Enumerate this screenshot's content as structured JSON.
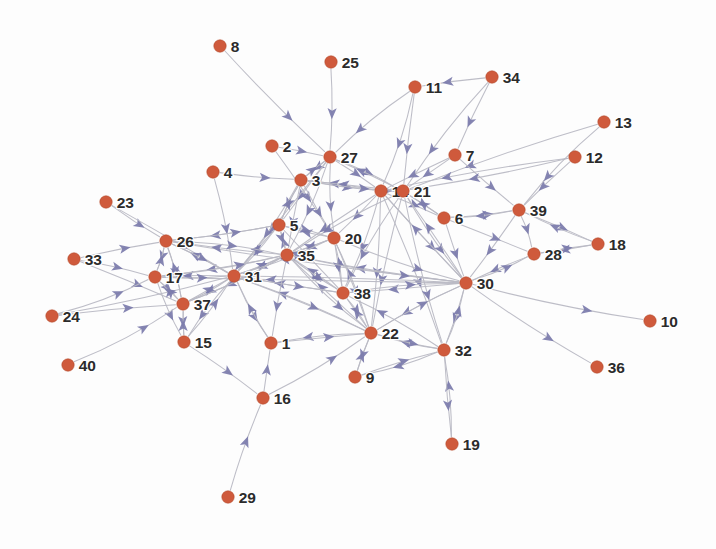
{
  "figure": {
    "background_color": "#fdfdfd",
    "width": 716,
    "height": 549
  },
  "style": {
    "node_fill": "#cf5a3c",
    "node_stroke": "#b4492c",
    "node_radius": 6.2,
    "edge_color": "#b9b9c4",
    "arrow_color": "#7b7bab",
    "label_color": "#2b2b2b",
    "label_font_size": 15.5
  },
  "chart_data": {
    "type": "scatter",
    "title": "",
    "xlabel": "",
    "ylabel": "",
    "grid": false,
    "legend": null,
    "graph_kind": "directed-node-link-diagram",
    "node_count": 40,
    "edge_count": 152,
    "nodes": [
      {
        "id": "1",
        "x": 271,
        "y": 343
      },
      {
        "id": "2",
        "x": 272,
        "y": 146
      },
      {
        "id": "3",
        "x": 301,
        "y": 180
      },
      {
        "id": "4",
        "x": 213,
        "y": 172
      },
      {
        "id": "5",
        "x": 279,
        "y": 225
      },
      {
        "id": "6",
        "x": 444,
        "y": 218
      },
      {
        "id": "7",
        "x": 455,
        "y": 155
      },
      {
        "id": "8",
        "x": 220,
        "y": 46
      },
      {
        "id": "9",
        "x": 355,
        "y": 377
      },
      {
        "id": "10",
        "x": 650,
        "y": 321
      },
      {
        "id": "11",
        "x": 415,
        "y": 87
      },
      {
        "id": "12",
        "x": 575,
        "y": 157
      },
      {
        "id": "13",
        "x": 604,
        "y": 122
      },
      {
        "id": "14",
        "x": 381,
        "y": 191
      },
      {
        "id": "15",
        "x": 184,
        "y": 342
      },
      {
        "id": "16",
        "x": 263,
        "y": 398
      },
      {
        "id": "17",
        "x": 155,
        "y": 277
      },
      {
        "id": "18",
        "x": 598,
        "y": 244
      },
      {
        "id": "19",
        "x": 452,
        "y": 444
      },
      {
        "id": "20",
        "x": 334,
        "y": 238
      },
      {
        "id": "21",
        "x": 403,
        "y": 191
      },
      {
        "id": "22",
        "x": 371,
        "y": 333
      },
      {
        "id": "23",
        "x": 106,
        "y": 202
      },
      {
        "id": "24",
        "x": 52,
        "y": 316
      },
      {
        "id": "25",
        "x": 331,
        "y": 62
      },
      {
        "id": "26",
        "x": 166,
        "y": 241
      },
      {
        "id": "27",
        "x": 330,
        "y": 157
      },
      {
        "id": "28",
        "x": 534,
        "y": 254
      },
      {
        "id": "29",
        "x": 228,
        "y": 497
      },
      {
        "id": "30",
        "x": 466,
        "y": 283
      },
      {
        "id": "31",
        "x": 234,
        "y": 276
      },
      {
        "id": "32",
        "x": 444,
        "y": 350
      },
      {
        "id": "33",
        "x": 74,
        "y": 259
      },
      {
        "id": "34",
        "x": 492,
        "y": 77
      },
      {
        "id": "35",
        "x": 287,
        "y": 255
      },
      {
        "id": "36",
        "x": 597,
        "y": 367
      },
      {
        "id": "37",
        "x": 183,
        "y": 304
      },
      {
        "id": "38",
        "x": 343,
        "y": 293
      },
      {
        "id": "39",
        "x": 519,
        "y": 210
      },
      {
        "id": "40",
        "x": 68,
        "y": 365
      }
    ],
    "edges": [
      [
        "8",
        "27"
      ],
      [
        "25",
        "27"
      ],
      [
        "11",
        "27"
      ],
      [
        "34",
        "11"
      ],
      [
        "34",
        "21"
      ],
      [
        "11",
        "14"
      ],
      [
        "2",
        "27"
      ],
      [
        "2",
        "20"
      ],
      [
        "4",
        "3"
      ],
      [
        "4",
        "31"
      ],
      [
        "23",
        "26"
      ],
      [
        "23",
        "31"
      ],
      [
        "13",
        "21"
      ],
      [
        "12",
        "39"
      ],
      [
        "7",
        "39"
      ],
      [
        "7",
        "14"
      ],
      [
        "7",
        "21"
      ],
      [
        "12",
        "14"
      ],
      [
        "27",
        "3"
      ],
      [
        "27",
        "14"
      ],
      [
        "27",
        "21"
      ],
      [
        "27",
        "35"
      ],
      [
        "27",
        "5"
      ],
      [
        "27",
        "31"
      ],
      [
        "3",
        "27"
      ],
      [
        "3",
        "5"
      ],
      [
        "3",
        "35"
      ],
      [
        "3",
        "20"
      ],
      [
        "3",
        "31"
      ],
      [
        "3",
        "14"
      ],
      [
        "14",
        "3"
      ],
      [
        "14",
        "21"
      ],
      [
        "14",
        "6"
      ],
      [
        "14",
        "20"
      ],
      [
        "14",
        "35"
      ],
      [
        "14",
        "38"
      ],
      [
        "14",
        "30"
      ],
      [
        "14",
        "22"
      ],
      [
        "14",
        "32"
      ],
      [
        "21",
        "14"
      ],
      [
        "21",
        "6"
      ],
      [
        "21",
        "30"
      ],
      [
        "21",
        "38"
      ],
      [
        "21",
        "22"
      ],
      [
        "21",
        "32"
      ],
      [
        "21",
        "3"
      ],
      [
        "21",
        "27"
      ],
      [
        "21",
        "35"
      ],
      [
        "6",
        "30"
      ],
      [
        "6",
        "39"
      ],
      [
        "6",
        "21"
      ],
      [
        "39",
        "18"
      ],
      [
        "39",
        "28"
      ],
      [
        "39",
        "6"
      ],
      [
        "18",
        "28"
      ],
      [
        "18",
        "39"
      ],
      [
        "28",
        "30"
      ],
      [
        "30",
        "10"
      ],
      [
        "30",
        "36"
      ],
      [
        "30",
        "28"
      ],
      [
        "30",
        "32"
      ],
      [
        "30",
        "22"
      ],
      [
        "30",
        "38"
      ],
      [
        "30",
        "14"
      ],
      [
        "30",
        "21"
      ],
      [
        "30",
        "35"
      ],
      [
        "30",
        "31"
      ],
      [
        "30",
        "17"
      ],
      [
        "30",
        "26"
      ],
      [
        "32",
        "30"
      ],
      [
        "32",
        "22"
      ],
      [
        "32",
        "38"
      ],
      [
        "32",
        "9"
      ],
      [
        "19",
        "32"
      ],
      [
        "22",
        "32"
      ],
      [
        "22",
        "30"
      ],
      [
        "22",
        "38"
      ],
      [
        "22",
        "35"
      ],
      [
        "22",
        "31"
      ],
      [
        "22",
        "20"
      ],
      [
        "22",
        "1"
      ],
      [
        "38",
        "22"
      ],
      [
        "38",
        "35"
      ],
      [
        "38",
        "31"
      ],
      [
        "38",
        "20"
      ],
      [
        "38",
        "30"
      ],
      [
        "38",
        "5"
      ],
      [
        "20",
        "35"
      ],
      [
        "20",
        "38"
      ],
      [
        "20",
        "22"
      ],
      [
        "20",
        "5"
      ],
      [
        "35",
        "31"
      ],
      [
        "35",
        "5"
      ],
      [
        "35",
        "20"
      ],
      [
        "35",
        "38"
      ],
      [
        "35",
        "22"
      ],
      [
        "35",
        "1"
      ],
      [
        "35",
        "17"
      ],
      [
        "35",
        "37"
      ],
      [
        "35",
        "26"
      ],
      [
        "31",
        "35"
      ],
      [
        "31",
        "37"
      ],
      [
        "31",
        "17"
      ],
      [
        "31",
        "15"
      ],
      [
        "31",
        "1"
      ],
      [
        "31",
        "26"
      ],
      [
        "31",
        "5"
      ],
      [
        "31",
        "20"
      ],
      [
        "31",
        "38"
      ],
      [
        "31",
        "22"
      ],
      [
        "5",
        "35"
      ],
      [
        "5",
        "31"
      ],
      [
        "5",
        "20"
      ],
      [
        "5",
        "3"
      ],
      [
        "26",
        "31"
      ],
      [
        "26",
        "17"
      ],
      [
        "26",
        "35"
      ],
      [
        "26",
        "37"
      ],
      [
        "17",
        "37"
      ],
      [
        "17",
        "31"
      ],
      [
        "17",
        "15"
      ],
      [
        "17",
        "26"
      ],
      [
        "33",
        "26"
      ],
      [
        "33",
        "17"
      ],
      [
        "33",
        "37"
      ],
      [
        "24",
        "37"
      ],
      [
        "24",
        "17"
      ],
      [
        "24",
        "31"
      ],
      [
        "40",
        "37"
      ],
      [
        "37",
        "15"
      ],
      [
        "37",
        "31"
      ],
      [
        "37",
        "17"
      ],
      [
        "37",
        "26"
      ],
      [
        "15",
        "37"
      ],
      [
        "15",
        "16"
      ],
      [
        "16",
        "1"
      ],
      [
        "16",
        "22"
      ],
      [
        "29",
        "16"
      ],
      [
        "1",
        "22"
      ],
      [
        "9",
        "22"
      ],
      [
        "9",
        "32"
      ],
      [
        "5",
        "26"
      ],
      [
        "35",
        "30"
      ],
      [
        "20",
        "30"
      ],
      [
        "3",
        "21"
      ],
      [
        "27",
        "20"
      ],
      [
        "11",
        "21"
      ],
      [
        "34",
        "7"
      ],
      [
        "13",
        "39"
      ],
      [
        "12",
        "21"
      ],
      [
        "28",
        "18"
      ],
      [
        "39",
        "30"
      ],
      [
        "6",
        "28"
      ],
      [
        "22",
        "9"
      ],
      [
        "32",
        "19"
      ],
      [
        "1",
        "31"
      ],
      [
        "15",
        "31"
      ],
      [
        "26",
        "5"
      ],
      [
        "17",
        "35"
      ],
      [
        "37",
        "35"
      ]
    ]
  }
}
